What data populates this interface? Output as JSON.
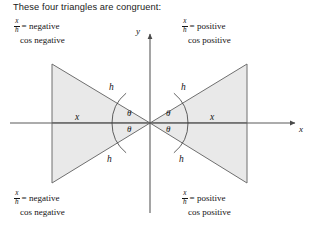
{
  "figure": {
    "heading": "These four triangles are congruent:",
    "axes": {
      "y_label": "y",
      "x_label": "x",
      "origin": {
        "x": 150,
        "y": 123
      },
      "x_axis_start": {
        "x": 10,
        "y": 123
      },
      "x_axis_end": {
        "x": 295,
        "y": 123
      },
      "y_axis_top": {
        "x": 150,
        "y": 32
      },
      "y_axis_bottom": {
        "x": 150,
        "y": 213
      }
    },
    "triangles": [
      {
        "quadrant": "upper-left",
        "vertices": [
          [
            150,
            123
          ],
          [
            52,
            64
          ],
          [
            52,
            123
          ]
        ],
        "hypotenuse_label": "h",
        "base_label": "x",
        "angle_label": "θ"
      },
      {
        "quadrant": "lower-left",
        "vertices": [
          [
            150,
            123
          ],
          [
            52,
            183
          ],
          [
            52,
            123
          ]
        ],
        "hypotenuse_label": "h",
        "base_label": "x",
        "angle_label": "θ"
      },
      {
        "quadrant": "upper-right",
        "vertices": [
          [
            150,
            123
          ],
          [
            247,
            64
          ],
          [
            247,
            123
          ]
        ],
        "hypotenuse_label": "h",
        "base_label": "x",
        "angle_label": "θ"
      },
      {
        "quadrant": "lower-right",
        "vertices": [
          [
            150,
            123
          ],
          [
            247,
            183
          ],
          [
            247,
            123
          ]
        ],
        "hypotenuse_label": "h",
        "base_label": "x",
        "angle_label": "θ"
      }
    ],
    "labels": {
      "h_top_left": "h",
      "h_bottom_left": "h",
      "h_top_right": "h",
      "h_bottom_right": "h",
      "x_left": "x",
      "x_right": "x",
      "theta_upper_left": "θ",
      "theta_lower_left": "θ",
      "theta_upper_right": "θ",
      "theta_lower_right": "θ"
    },
    "colors": {
      "triangle_fill": "#e9e9e9",
      "triangle_stroke": "#6f6f6f",
      "axis_stroke": "#5a5a5a",
      "text": "#141414",
      "background": "#ffffff"
    }
  },
  "annotations": {
    "top_left": {
      "numerator": "x",
      "denominator": "h",
      "equals": "= negative",
      "line2": "cos negative"
    },
    "top_right": {
      "numerator": "x",
      "denominator": "h",
      "equals": "= positive",
      "line2": "cos positive"
    },
    "bottom_left": {
      "numerator": "x",
      "denominator": "h",
      "equals": "= negative",
      "line2": "cos negative"
    },
    "bottom_right": {
      "numerator": "x",
      "denominator": "h",
      "equals": "= positive",
      "line2": "cos positive"
    }
  }
}
